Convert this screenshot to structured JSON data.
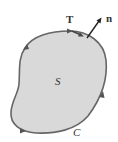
{
  "diagram": {
    "title": "",
    "region_label": "S",
    "curve_label": "C",
    "tangent_label": "T",
    "normal_label": "n",
    "colors": {
      "region_fill": "#d9d9d9",
      "boundary": "#666666",
      "vector": "#222222",
      "label": "#333333"
    },
    "elements": [
      {
        "id": "region",
        "type": "closed-curve",
        "label": "S",
        "description": "shaded region"
      },
      {
        "id": "boundary",
        "type": "oriented-curve",
        "label": "C",
        "orientation": "counterclockwise",
        "arrow_count": 4
      },
      {
        "id": "tangent",
        "type": "vector",
        "label": "T",
        "direction": "tangent to boundary"
      },
      {
        "id": "normal",
        "type": "vector",
        "label": "n",
        "direction": "outward normal"
      }
    ]
  }
}
